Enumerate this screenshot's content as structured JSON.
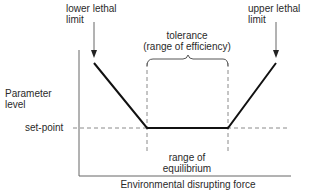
{
  "diagram": {
    "clipped_top_text": "",
    "labels": {
      "lower_lethal_limit": "lower lethal",
      "lower_lethal_limit_2": "limit",
      "upper_lethal_limit": "upper lethal",
      "upper_lethal_limit_2": "limit",
      "tolerance": "tolerance",
      "tolerance_sub": "(range of efficiency)",
      "y_axis_label_1": "Parameter",
      "y_axis_label_2": "level",
      "set_point": "set-point",
      "equilibrium_1": "range of",
      "equilibrium_2": "equilibrium",
      "x_axis_label": "Environmental disrupting force"
    },
    "colors": {
      "line": "#111111",
      "axis": "#555555",
      "dashed": "#8a8a8a",
      "text": "#2a2a2a"
    },
    "curve_points": [
      [
        94,
        63
      ],
      [
        147,
        128
      ],
      [
        228,
        128
      ],
      [
        276,
        63
      ]
    ]
  }
}
